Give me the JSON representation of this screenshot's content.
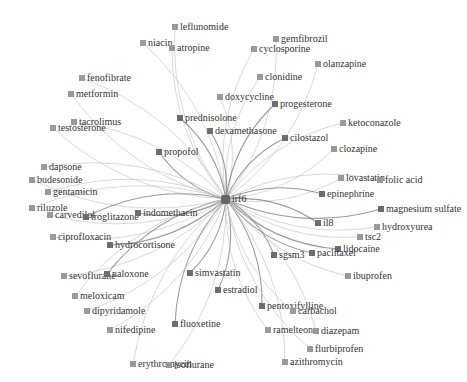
{
  "graph": {
    "hub": {
      "label": "irf6",
      "x": 226,
      "y": 199
    },
    "edge_color": "#c8c8c8",
    "edge_color_strong": "#7a7a7a",
    "node_color": "#9a9a9a",
    "nodes": [
      {
        "label": "leflunomide",
        "x": 172,
        "y": 22,
        "strong": false
      },
      {
        "label": "niacin",
        "x": 140,
        "y": 38,
        "strong": false
      },
      {
        "label": "atropine",
        "x": 169,
        "y": 43,
        "strong": false
      },
      {
        "label": "gemfibrozil",
        "x": 273,
        "y": 34,
        "strong": false
      },
      {
        "label": "cyclosporine",
        "x": 251,
        "y": 44,
        "strong": false
      },
      {
        "label": "olanzapine",
        "x": 315,
        "y": 59,
        "strong": false
      },
      {
        "label": "clonidine",
        "x": 257,
        "y": 72,
        "strong": false
      },
      {
        "label": "fenofibrate",
        "x": 79,
        "y": 73,
        "strong": false
      },
      {
        "label": "metformin",
        "x": 68,
        "y": 89,
        "strong": false
      },
      {
        "label": "doxycycline",
        "x": 217,
        "y": 92,
        "strong": false
      },
      {
        "label": "progesterone",
        "x": 272,
        "y": 99,
        "strong": true
      },
      {
        "label": "prednisolone",
        "x": 177,
        "y": 113,
        "strong": true
      },
      {
        "label": "ketoconazole",
        "x": 340,
        "y": 118,
        "strong": false
      },
      {
        "label": "tacrolimus",
        "x": 71,
        "y": 117,
        "strong": false
      },
      {
        "label": "testosterone",
        "x": 50,
        "y": 123,
        "strong": false
      },
      {
        "label": "dexamethasone",
        "x": 207,
        "y": 126,
        "strong": true
      },
      {
        "label": "cilostazol",
        "x": 282,
        "y": 133,
        "strong": true
      },
      {
        "label": "clozapine",
        "x": 331,
        "y": 144,
        "strong": false
      },
      {
        "label": "propofol",
        "x": 156,
        "y": 147,
        "strong": true
      },
      {
        "label": "dapsone",
        "x": 41,
        "y": 162,
        "strong": false
      },
      {
        "label": "budesonide",
        "x": 29,
        "y": 175,
        "strong": false
      },
      {
        "label": "lovastatin",
        "x": 338,
        "y": 173,
        "strong": false
      },
      {
        "label": "folic acid",
        "x": 377,
        "y": 175,
        "strong": false
      },
      {
        "label": "gentamicin",
        "x": 45,
        "y": 187,
        "strong": false
      },
      {
        "label": "epinephrine",
        "x": 319,
        "y": 189,
        "strong": true
      },
      {
        "label": "riluzole",
        "x": 29,
        "y": 203,
        "strong": false
      },
      {
        "label": "carvedilol",
        "x": 47,
        "y": 210,
        "strong": false
      },
      {
        "label": "troglitazone",
        "x": 83,
        "y": 212,
        "strong": true
      },
      {
        "label": "indomethacin",
        "x": 135,
        "y": 208,
        "strong": true
      },
      {
        "label": "magnesium sulfate",
        "x": 378,
        "y": 204,
        "strong": true
      },
      {
        "label": "il8",
        "x": 315,
        "y": 218,
        "strong": true
      },
      {
        "label": "hydroxyurea",
        "x": 374,
        "y": 222,
        "strong": false
      },
      {
        "label": "ciprofloxacin",
        "x": 50,
        "y": 232,
        "strong": false
      },
      {
        "label": "tsc2",
        "x": 357,
        "y": 232,
        "strong": false
      },
      {
        "label": "hydrocortisone",
        "x": 107,
        "y": 240,
        "strong": true
      },
      {
        "label": "lidocaine",
        "x": 335,
        "y": 244,
        "strong": true
      },
      {
        "label": "sgsm3",
        "x": 271,
        "y": 250,
        "strong": true
      },
      {
        "label": "paclitaxel",
        "x": 309,
        "y": 248,
        "strong": true
      },
      {
        "label": "sevoflurane",
        "x": 61,
        "y": 271,
        "strong": false
      },
      {
        "label": "naloxone",
        "x": 104,
        "y": 269,
        "strong": true
      },
      {
        "label": "simvastatin",
        "x": 187,
        "y": 268,
        "strong": true
      },
      {
        "label": "ibuprofen",
        "x": 345,
        "y": 271,
        "strong": false
      },
      {
        "label": "estradiol",
        "x": 215,
        "y": 285,
        "strong": true
      },
      {
        "label": "meloxicam",
        "x": 72,
        "y": 291,
        "strong": false
      },
      {
        "label": "pentoxifylline",
        "x": 259,
        "y": 301,
        "strong": true
      },
      {
        "label": "carbachol",
        "x": 290,
        "y": 306,
        "strong": false
      },
      {
        "label": "dipyridamole",
        "x": 84,
        "y": 306,
        "strong": false
      },
      {
        "label": "fluoxetine",
        "x": 172,
        "y": 319,
        "strong": true
      },
      {
        "label": "nifedipine",
        "x": 107,
        "y": 325,
        "strong": false
      },
      {
        "label": "ramelteon",
        "x": 265,
        "y": 325,
        "strong": false
      },
      {
        "label": "diazepam",
        "x": 313,
        "y": 326,
        "strong": false
      },
      {
        "label": "flurbiprofen",
        "x": 307,
        "y": 344,
        "strong": false
      },
      {
        "label": "azithromycin",
        "x": 282,
        "y": 357,
        "strong": false
      },
      {
        "label": "erythromycin",
        "x": 130,
        "y": 359,
        "strong": false
      },
      {
        "label": "isoflurane",
        "x": 166,
        "y": 360,
        "strong": false
      }
    ]
  }
}
